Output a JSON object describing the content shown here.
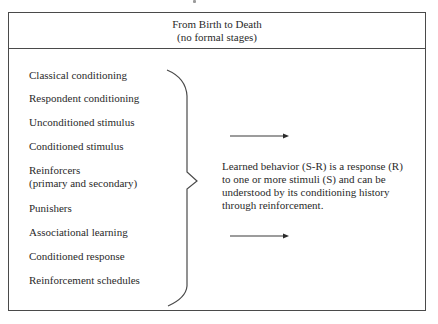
{
  "header": {
    "title": "From Birth to Death",
    "subtitle": "(no formal stages)"
  },
  "terms": [
    {
      "label": "Classical conditioning"
    },
    {
      "label": "Respondent conditioning"
    },
    {
      "label": "Unconditioned stimulus"
    },
    {
      "label": "Conditioned stimulus"
    },
    {
      "label": "Reinforcers",
      "sublabel": "(primary and secondary)"
    },
    {
      "label": "Punishers"
    },
    {
      "label": "Associational learning"
    },
    {
      "label": "Conditioned response"
    },
    {
      "label": "Reinforcement schedules"
    }
  ],
  "description": {
    "lines": [
      "Learned behavior (S-R) is a response (R)",
      "to one or more stimuli (S) and can be",
      "understood by its conditioning history",
      "through reinforcement."
    ]
  },
  "icons": {
    "brace": "right-curly-brace",
    "arrows": [
      "right-arrow",
      "right-arrow"
    ]
  },
  "colors": {
    "line": "#4a4a4a",
    "text": "#2a2a2a",
    "background": "#ffffff"
  }
}
